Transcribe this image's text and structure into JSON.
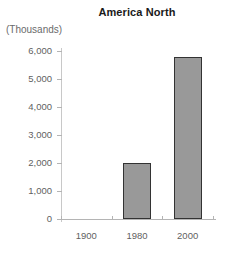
{
  "chart_data": {
    "type": "bar",
    "title": "America North",
    "xlabel": "",
    "ylabel": "(Thousands)",
    "categories": [
      "1900",
      "1980",
      "2000"
    ],
    "values": [
      0,
      2000,
      5800
    ],
    "ylim": [
      0,
      6000
    ],
    "ytick_values": [
      0,
      1000,
      2000,
      3000,
      4000,
      5000,
      6000
    ],
    "ytick_labels": [
      "0",
      "1,000",
      "2,000",
      "3,000",
      "4,000",
      "5,000",
      "6,000"
    ],
    "grid": false,
    "legend": false,
    "series": [
      {
        "name": "America North",
        "values": [
          0,
          2000,
          5800
        ]
      }
    ],
    "colors": {
      "bar_fill": "#999999",
      "bar_border": "#333333",
      "axis": "#b4b4b4",
      "title_text": "#1a1a1a",
      "tick_text": "#5f5f5f",
      "background": "#ffffff"
    }
  }
}
